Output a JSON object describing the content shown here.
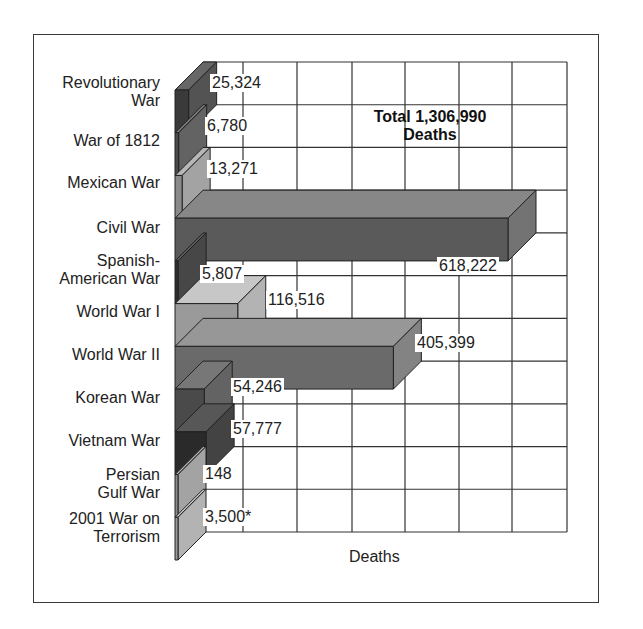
{
  "chart_data": {
    "type": "bar",
    "orientation": "horizontal",
    "style": "3d",
    "title": "",
    "annotation": "Total 1,306,990 Deaths",
    "annotation_lines": [
      "Total 1,306,990",
      "Deaths"
    ],
    "xlabel": "Deaths",
    "ylabel": "",
    "grid": true,
    "legend": null,
    "categories": [
      "Revolutionary War",
      "War of 1812",
      "Mexican War",
      "Civil War",
      "Spanish-American War",
      "World War I",
      "World War II",
      "Korean War",
      "Vietnam War",
      "Persian Gulf War",
      "2001 War on Terrorism"
    ],
    "category_label_lines": [
      [
        "Revolutionary",
        "War"
      ],
      [
        "War of 1812"
      ],
      [
        "Mexican War"
      ],
      [
        "Civil War"
      ],
      [
        "Spanish-",
        "American War"
      ],
      [
        "World War I"
      ],
      [
        "World War II"
      ],
      [
        "Korean War"
      ],
      [
        "Vietnam War"
      ],
      [
        "Persian",
        "Gulf War"
      ],
      [
        "2001 War on",
        "Terrorism"
      ]
    ],
    "values": [
      25324,
      6780,
      13271,
      618222,
      5807,
      116516,
      405399,
      54246,
      57777,
      148,
      3500
    ],
    "value_labels": [
      "25,324",
      "6,780",
      "13,271",
      "618,222",
      "5,807",
      "116,516",
      "405,399",
      "54,246",
      "57,777",
      "148",
      "3,500*"
    ],
    "xlim": [
      0,
      700000
    ],
    "bar_colors": [
      "#3a3a3a",
      "#4a4a4a",
      "#8a8a8a",
      "#5a5a5a",
      "#2e2e2e",
      "#9a9a9a",
      "#6a6a6a",
      "#4a4a4a",
      "#2a2a2a",
      "#8a8a8a",
      "#9a9a9a"
    ]
  }
}
